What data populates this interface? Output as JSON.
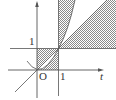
{
  "diagram": {
    "type": "region-plot",
    "axes": {
      "x_label": "t",
      "origin_label": "O",
      "x_tick_label": "1",
      "y_tick_label": "1"
    },
    "curves": [
      {
        "name": "line",
        "equation": "y = t"
      },
      {
        "name": "parabola",
        "equation": "y = t^2"
      },
      {
        "name": "vertical-line",
        "equation": "t = 1"
      },
      {
        "name": "horizontal-line",
        "equation": "y = 1"
      }
    ],
    "shaded_regions": [
      {
        "name": "unit-square-minus-lens",
        "description": "0 ≤ t ≤ 1, 0 ≤ y ≤ 1, excluding region between y=t² and y=t"
      },
      {
        "name": "upper-strip",
        "description": "t ≥ 1, y ≥ t², bounded by t = 1"
      },
      {
        "name": "right-wedge",
        "description": "t ≥ 1, 1 ≤ y ≤ t"
      }
    ],
    "colors": {
      "axis": "#555555",
      "hatch": "#8a8a8a",
      "background": "#ffffff"
    }
  }
}
